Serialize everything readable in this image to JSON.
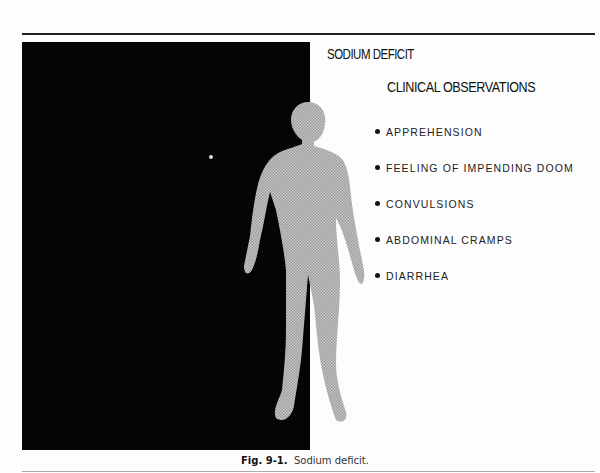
{
  "figure": {
    "title": "SODIUM DEFICIT",
    "subtitle": "CLINICAL OBSERVATIONS",
    "observations": [
      "APPREHENSION",
      "FEELING OF IMPENDING DOOM",
      "CONVULSIONS",
      "ABDOMINAL CRAMPS",
      "DIARRHEA"
    ],
    "caption_label": "Fig. 9-1.",
    "caption_text": "Sodium deficit.",
    "colors": {
      "panel": "#050505",
      "figure": "#a8a8a8",
      "text": "#111111"
    }
  }
}
